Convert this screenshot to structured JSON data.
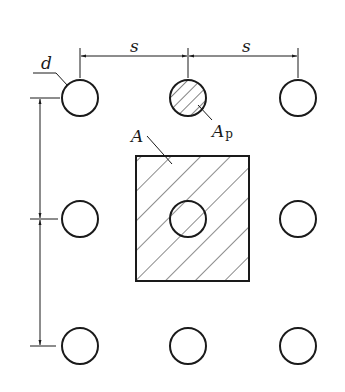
{
  "diagram": {
    "labels": {
      "spacing_top_left": "s",
      "spacing_top_right": "s",
      "diameter": "d",
      "area_cell": "A",
      "area_pile_main": "A",
      "area_pile_sub": "p"
    },
    "grid": {
      "rows": 3,
      "cols": 3,
      "x": [
        80,
        188,
        298
      ],
      "y": [
        98,
        219,
        346
      ],
      "radius": 18
    },
    "colors": {
      "stroke": "#1a1a1a",
      "background": "#ffffff"
    }
  }
}
